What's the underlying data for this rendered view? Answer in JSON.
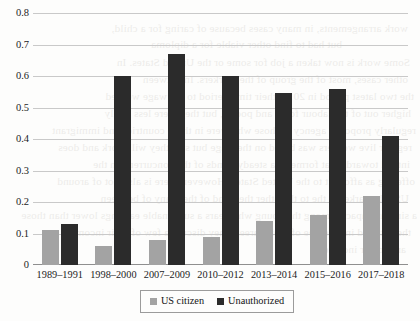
{
  "chart_data": {
    "type": "bar",
    "title": "",
    "subtitle": "",
    "xlabel": "",
    "ylabel": "",
    "categories": [
      "1989–1991",
      "1998–2000",
      "2007–2009",
      "2010–2012",
      "2013–2014",
      "2015–2016",
      "2017–2018"
    ],
    "series": [
      {
        "name": "US citizen",
        "color": "#a3a3a3",
        "values": [
          0.11,
          0.06,
          0.08,
          0.09,
          0.14,
          0.16,
          0.22
        ]
      },
      {
        "name": "Unauthorized",
        "color": "#2b2b2b",
        "values": [
          0.13,
          0.6,
          0.67,
          0.6,
          0.545,
          0.56,
          0.41
        ]
      }
    ],
    "ylim": [
      0,
      0.8
    ],
    "ytick_values": [
      0,
      0.1,
      0.2,
      0.3,
      0.4,
      0.5,
      0.6,
      0.7,
      0.8
    ],
    "ytick_labels": [
      "0",
      "0.1",
      "0.2",
      "0.3",
      "0.4",
      "0.5",
      "0.6",
      "0.7",
      "0.8"
    ],
    "grid": true,
    "grid_axis": "y",
    "legend_position": "bottom-center",
    "legend_entries": [
      "US citizen",
      "Unauthorized"
    ]
  },
  "legend": {
    "items": [
      {
        "label": "US citizen",
        "swatch": "gray-square-icon"
      },
      {
        "label": "Unauthorized",
        "swatch": "black-square-icon"
      }
    ]
  },
  "page_bleed_through": {
    "note": "faint mirrored text showing through from the reverse side of the printed page",
    "lines": [
      "work arrangements, in many cases because of caring for a child,",
      "but had to find other viable for a diploma",
      "Some work is now taken a job for some or the United States. In",
      "other cases, most of the group of the workers. In between",
      "the two latest period in 2013, their time period to the wage worked",
      "higher out of the labour force and poorer, but they were less likely",
      "regularly proposed agency to those who were in these countries and immigrant",
      "regular live workers was based on the wage but still they will work and does",
      "intend towards that formerly a steady trends of the concurrent on the",
      "offering as afford it to the United States. However, there is also not of around",
      "US job-market in the to the other the trend of the many of between",
      "a similar impacts among the young who bears a sustainable earnings lower than those",
      "they started in a degree of their careers they discuss a few of their income",
      "and lower income",
      "Canadian Trends"
    ]
  }
}
